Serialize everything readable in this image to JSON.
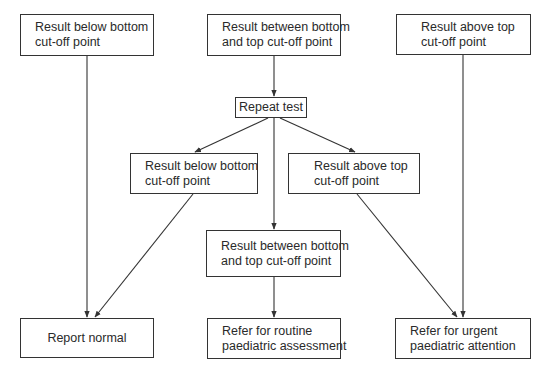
{
  "flowchart": {
    "nodes": {
      "top_below": {
        "lines": [
          "Result below bottom",
          "cut-off point"
        ]
      },
      "top_between": {
        "lines": [
          "Result between bottom",
          "and top cut-off point"
        ]
      },
      "top_above": {
        "lines": [
          "Result above top",
          "cut-off point"
        ]
      },
      "repeat": {
        "lines": [
          "Repeat test"
        ]
      },
      "mid_below": {
        "lines": [
          "Result below bottom",
          "cut-off point"
        ]
      },
      "mid_above": {
        "lines": [
          "Result above top",
          "cut-off point"
        ]
      },
      "mid_between": {
        "lines": [
          "Result between bottom",
          "and top cut-off point"
        ]
      },
      "report_normal": {
        "lines": [
          "Report normal"
        ]
      },
      "refer_routine": {
        "lines": [
          "Refer for routine",
          "paediatric assessment"
        ]
      },
      "refer_urgent": {
        "lines": [
          "Refer for urgent",
          "paediatric attention"
        ]
      }
    },
    "edges": [
      [
        "top_below",
        "report_normal"
      ],
      [
        "top_between",
        "repeat"
      ],
      [
        "top_above",
        "refer_urgent"
      ],
      [
        "repeat",
        "mid_below"
      ],
      [
        "repeat",
        "mid_between"
      ],
      [
        "repeat",
        "mid_above"
      ],
      [
        "mid_below",
        "report_normal"
      ],
      [
        "mid_above",
        "refer_urgent"
      ],
      [
        "mid_between",
        "refer_routine"
      ]
    ],
    "colors": {
      "line": "#333333",
      "text": "#2a2a2a",
      "background": "#ffffff"
    }
  }
}
